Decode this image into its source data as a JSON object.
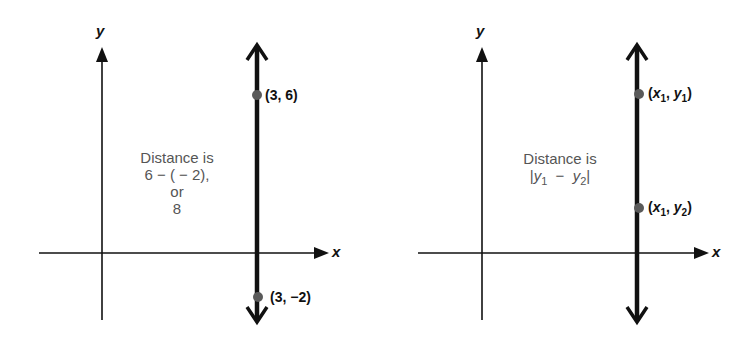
{
  "colors": {
    "line": "#111111",
    "point": "#5a5a5a",
    "annotation": "#555555"
  },
  "panels": [
    {
      "id": "numeric",
      "axis_labels": {
        "x": "x",
        "y": "y"
      },
      "vertical_line": {
        "x_value": "3"
      },
      "points": [
        {
          "label": "(3, 6)",
          "x": 3,
          "y": 6
        },
        {
          "label": "(3,  −2)",
          "x": 3,
          "y": -2
        }
      ],
      "annotation": {
        "line1": "Distance is",
        "line2": "6 − ( − 2),",
        "line3": "or",
        "line4": "8"
      }
    },
    {
      "id": "general",
      "axis_labels": {
        "x": "x",
        "y": "y"
      },
      "vertical_line": {
        "x_value": "x₁"
      },
      "points": [
        {
          "label_var_x": "x",
          "label_sub_x": "1",
          "label_var_y": "y",
          "label_sub_y": "1"
        },
        {
          "label_var_x": "x",
          "label_sub_x": "1",
          "label_var_y": "y",
          "label_sub_y": "2"
        }
      ],
      "annotation": {
        "line1": "Distance is",
        "abs_var_a": "y",
        "abs_sub_a": "1",
        "minus": "−",
        "abs_var_b": "y",
        "abs_sub_b": "2"
      }
    }
  ]
}
